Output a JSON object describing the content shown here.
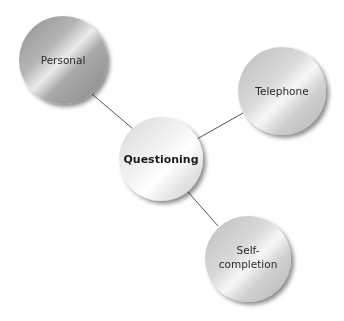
{
  "diagram": {
    "type": "hub-and-spoke",
    "center": {
      "id": "questioning",
      "label": "Questioning",
      "cx": 161,
      "cy": 159,
      "r": 42
    },
    "nodes": [
      {
        "id": "personal",
        "label_lines": [
          "Personal"
        ],
        "cx": 63,
        "cy": 60,
        "r": 44,
        "style": "dark"
      },
      {
        "id": "telephone",
        "label_lines": [
          "Telephone"
        ],
        "cx": 282,
        "cy": 91,
        "r": 44,
        "style": "light"
      },
      {
        "id": "self-completion",
        "label_lines": [
          "Self-",
          "completion"
        ],
        "cx": 248,
        "cy": 259,
        "r": 43,
        "style": "light"
      }
    ],
    "edges": [
      {
        "from": "questioning",
        "to": "personal"
      },
      {
        "from": "questioning",
        "to": "telephone"
      },
      {
        "from": "questioning",
        "to": "self-completion"
      }
    ],
    "colors": {
      "line": "#555555",
      "text": "#2a2a2a",
      "background": "#ffffff"
    }
  }
}
